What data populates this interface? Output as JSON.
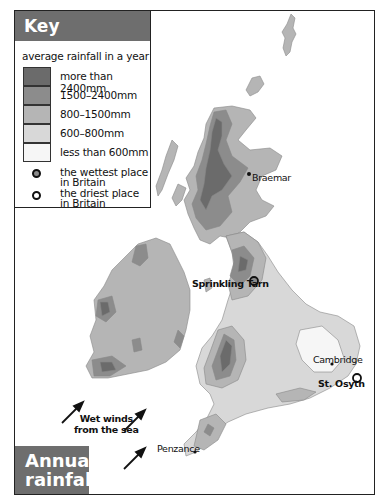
{
  "title": {
    "line1": "Annual",
    "line2": "rainfall"
  },
  "key": {
    "heading": "Key",
    "subtitle": "average rainfall in a year",
    "bands": [
      {
        "label": "more than 2400mm",
        "color": "#6b6b6b"
      },
      {
        "label": "1500–2400mm",
        "color": "#8c8c8c"
      },
      {
        "label": "800–1500mm",
        "color": "#b5b5b5"
      },
      {
        "label": "600–800mm",
        "color": "#d8d8d8"
      },
      {
        "label": "less than 600mm",
        "color": "#f6f6f6"
      }
    ],
    "symbols": [
      {
        "label_line1": "the wettest place",
        "label_line2": "in Britain",
        "fill": "#8c8c8c"
      },
      {
        "label_line1": "the driest place",
        "label_line2": "in Britain",
        "fill": "#ffffff"
      }
    ]
  },
  "places": [
    {
      "name": "Braemar",
      "marker": "dot"
    },
    {
      "name": "Sprinkling Tarn",
      "marker": "wettest"
    },
    {
      "name": "Cambridge",
      "marker": "dot"
    },
    {
      "name": "St. Osyth",
      "marker": "driest"
    },
    {
      "name": "Penzance",
      "marker": "dot"
    }
  ],
  "annotation": {
    "line1": "Wet winds",
    "line2": "from the sea"
  }
}
